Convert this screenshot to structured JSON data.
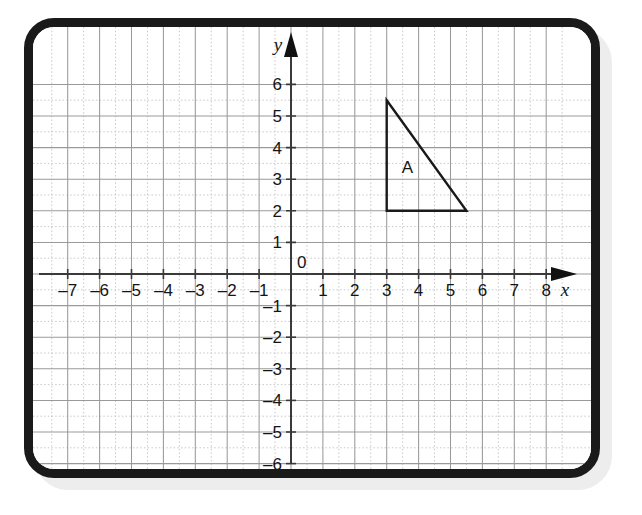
{
  "board": {
    "type": "whiteboard",
    "frame_color": "#1a1a1a",
    "surface_color": "#ffffff",
    "shadow_color": "#ededed"
  },
  "chart_data": {
    "type": "scatter",
    "title": "",
    "xlabel": "x",
    "ylabel": "y",
    "xlim": [
      -7.6,
      8.6
    ],
    "ylim": [
      -6.5,
      6.4
    ],
    "grid": true,
    "minor_grid": true,
    "grid_step": 1,
    "minor_grid_step": 0.5,
    "legend": "none",
    "origin_label": "0",
    "x_tick_labels": [
      "-7",
      "-6",
      "-5",
      "-4",
      "-3",
      "-2",
      "-1",
      "1",
      "2",
      "3",
      "4",
      "5",
      "6",
      "7",
      "8"
    ],
    "x_tick_values": [
      -7,
      -6,
      -5,
      -4,
      -3,
      -2,
      -1,
      1,
      2,
      3,
      4,
      5,
      6,
      7,
      8
    ],
    "y_tick_labels": [
      "6",
      "5",
      "4",
      "3",
      "2",
      "1",
      "-1",
      "-2",
      "-3",
      "-4",
      "-5",
      "-6"
    ],
    "y_tick_values": [
      6,
      5,
      4,
      3,
      2,
      1,
      -1,
      -2,
      -3,
      -4,
      -5,
      -6
    ],
    "shapes": [
      {
        "name": "A",
        "kind": "triangle",
        "label": "A",
        "label_position": [
          3.65,
          3.2
        ],
        "vertices": [
          [
            3,
            5.5
          ],
          [
            3,
            2
          ],
          [
            5.5,
            2
          ]
        ],
        "stroke": "#1a1a1a",
        "fill": "none",
        "stroke_width": 2.4
      }
    ],
    "axis_color": "#3a3a3a",
    "grid_color": "#9a9a9a",
    "minor_grid_color": "#c8c8c8"
  }
}
